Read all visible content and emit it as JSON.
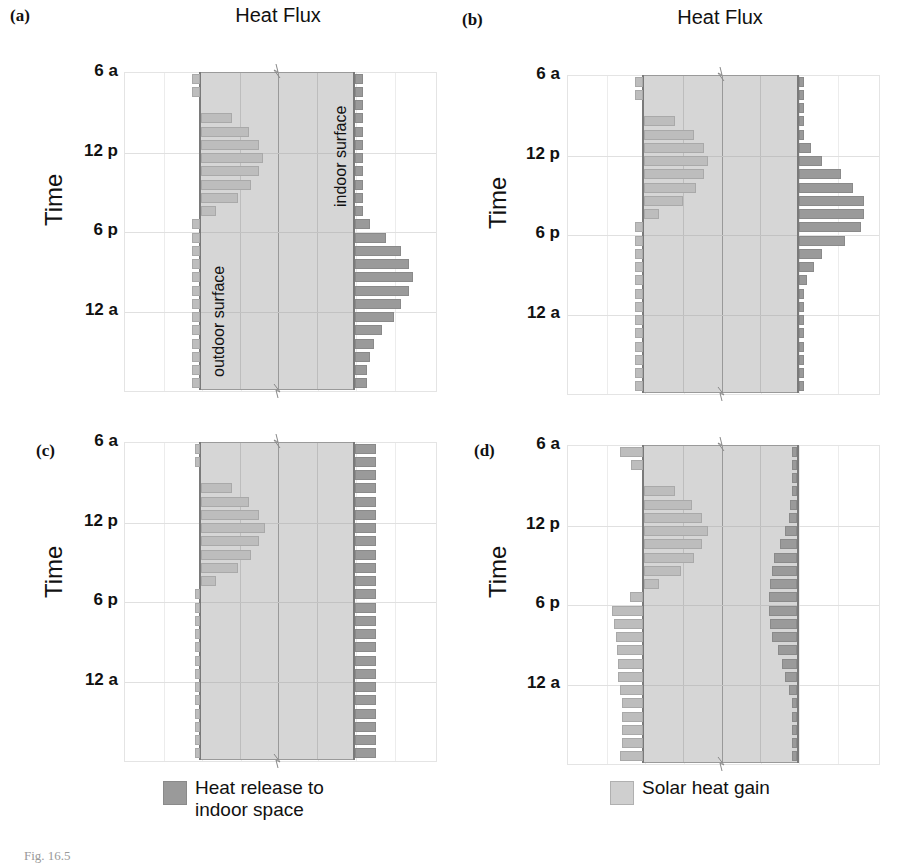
{
  "figure": {
    "caption_fragment": "Fig. 16.5"
  },
  "colors": {
    "solar": "#bdbdbd",
    "indoor": "#9a9a9a",
    "wall": "#d6d6d6",
    "wall_edge": "#7a7a7a"
  },
  "panels": [
    {
      "letter": "(a)",
      "title": "Heat Flux",
      "ylabel": "Time",
      "ticks": [
        "6 a",
        "12 p",
        "6 p",
        "12 a"
      ],
      "annotations": {
        "outdoor": "outdoor surface",
        "indoor": "indoor surface"
      }
    },
    {
      "letter": "(b)",
      "title": "Heat Flux",
      "ylabel": "Time",
      "ticks": [
        "6 a",
        "12 p",
        "6 p",
        "12 a"
      ]
    },
    {
      "letter": "(c)",
      "title": "",
      "ylabel": "Time",
      "ticks": [
        "6 a",
        "12 p",
        "6 p",
        "12 a"
      ]
    },
    {
      "letter": "(d)",
      "title": "",
      "ylabel": "Time",
      "ticks": [
        "6 a",
        "12 p",
        "6 p",
        "12 a"
      ]
    }
  ],
  "legend": {
    "indoor_label": "Heat release to indoor space",
    "solar_label": "Solar heat gain"
  },
  "chart_data": [
    {
      "type": "bar",
      "orientation": "horizontal",
      "title": "Heat Flux",
      "panel": "(a)",
      "xlabel": "Heat Flux",
      "ylabel": "Time",
      "categories": [
        "6a",
        "7a",
        "8a",
        "9a",
        "10a",
        "11a",
        "12p",
        "1p",
        "2p",
        "3p",
        "4p",
        "5p",
        "6p",
        "7p",
        "8p",
        "9p",
        "10p",
        "11p",
        "12a",
        "1a",
        "2a",
        "3a",
        "4a",
        "5a"
      ],
      "tick_labels": [
        "6 a",
        "12 p",
        "6 p",
        "12 a"
      ],
      "series": [
        {
          "name": "Solar heat gain (outdoor surface, into wall)",
          "side": "outdoor",
          "direction": "into-wall",
          "values": [
            -0.2,
            -0.2,
            0,
            0.8,
            1.25,
            1.5,
            1.6,
            1.5,
            1.3,
            0.95,
            0.4,
            -0.2,
            -0.2,
            -0.2,
            -0.2,
            -0.2,
            -0.2,
            -0.2,
            -0.2,
            -0.2,
            -0.2,
            -0.2,
            -0.2,
            -0.2
          ]
        },
        {
          "name": "Heat release to indoor space (indoor surface)",
          "side": "indoor",
          "direction": "out-of-wall",
          "values": [
            0.2,
            0.2,
            0.2,
            0.2,
            0.2,
            0.2,
            0.2,
            0.2,
            0.2,
            0.2,
            0.2,
            0.4,
            0.8,
            1.2,
            1.4,
            1.5,
            1.4,
            1.2,
            1.0,
            0.7,
            0.5,
            0.4,
            0.3,
            0.3
          ]
        }
      ],
      "grid": true
    },
    {
      "type": "bar",
      "orientation": "horizontal",
      "title": "Heat Flux",
      "panel": "(b)",
      "ylabel": "Time",
      "categories": [
        "6a",
        "7a",
        "8a",
        "9a",
        "10a",
        "11a",
        "12p",
        "1p",
        "2p",
        "3p",
        "4p",
        "5p",
        "6p",
        "7p",
        "8p",
        "9p",
        "10p",
        "11p",
        "12a",
        "1a",
        "2a",
        "3a",
        "4a",
        "5a"
      ],
      "tick_labels": [
        "6 a",
        "12 p",
        "6 p",
        "12 a"
      ],
      "series": [
        {
          "name": "Solar heat gain (outdoor surface)",
          "side": "outdoor",
          "direction": "into-wall",
          "values": [
            -0.2,
            -0.2,
            0,
            0.8,
            1.3,
            1.55,
            1.65,
            1.55,
            1.35,
            1.0,
            0.4,
            -0.2,
            -0.2,
            -0.2,
            -0.2,
            -0.2,
            -0.2,
            -0.2,
            -0.2,
            -0.2,
            -0.2,
            -0.2,
            -0.2,
            -0.2
          ]
        },
        {
          "name": "Heat release to indoor space (indoor surface)",
          "side": "indoor",
          "direction": "out-of-wall",
          "values": [
            0.1,
            0.1,
            0.1,
            0.1,
            0.1,
            0.3,
            0.6,
            1.1,
            1.4,
            1.7,
            1.7,
            1.6,
            1.2,
            0.6,
            0.4,
            0.2,
            0.1,
            0.1,
            0.1,
            0.1,
            0.1,
            0.1,
            0.1,
            0.1
          ]
        }
      ],
      "grid": true
    },
    {
      "type": "bar",
      "orientation": "horizontal",
      "panel": "(c)",
      "ylabel": "Time",
      "categories": [
        "6a",
        "7a",
        "8a",
        "9a",
        "10a",
        "11a",
        "12p",
        "1p",
        "2p",
        "3p",
        "4p",
        "5p",
        "6p",
        "7p",
        "8p",
        "9p",
        "10p",
        "11p",
        "12a",
        "1a",
        "2a",
        "3a",
        "4a",
        "5a"
      ],
      "tick_labels": [
        "6 a",
        "12 p",
        "6 p",
        "12 a"
      ],
      "series": [
        {
          "name": "Solar heat gain (outdoor surface)",
          "side": "outdoor",
          "direction": "into-wall",
          "values": [
            -0.1,
            -0.1,
            0,
            0.8,
            1.25,
            1.5,
            1.65,
            1.5,
            1.3,
            0.95,
            0.4,
            -0.1,
            -0.1,
            -0.1,
            -0.1,
            -0.1,
            -0.1,
            -0.1,
            -0.1,
            -0.1,
            -0.1,
            -0.1,
            -0.1,
            -0.1
          ]
        },
        {
          "name": "Heat release to indoor space (indoor surface)",
          "side": "indoor",
          "direction": "out-of-wall",
          "values": [
            0.55,
            0.55,
            0.55,
            0.55,
            0.55,
            0.55,
            0.55,
            0.55,
            0.55,
            0.55,
            0.55,
            0.55,
            0.55,
            0.55,
            0.55,
            0.55,
            0.55,
            0.55,
            0.55,
            0.55,
            0.55,
            0.55,
            0.55,
            0.55
          ]
        }
      ],
      "grid": true
    },
    {
      "type": "bar",
      "orientation": "horizontal",
      "panel": "(d)",
      "ylabel": "Time",
      "categories": [
        "6a",
        "7a",
        "8a",
        "9a",
        "10a",
        "11a",
        "12p",
        "1p",
        "2p",
        "3p",
        "4p",
        "5p",
        "6p",
        "7p",
        "8p",
        "9p",
        "10p",
        "11p",
        "12a",
        "1a",
        "2a",
        "3a",
        "4a",
        "5a"
      ],
      "tick_labels": [
        "6 a",
        "12 p",
        "6 p",
        "12 a"
      ],
      "series": [
        {
          "name": "Solar heat gain (outdoor surface)",
          "side": "outdoor",
          "direction": "into-wall (negative = out of wall)",
          "values": [
            -0.6,
            -0.3,
            0,
            0.8,
            1.25,
            1.5,
            1.65,
            1.5,
            1.3,
            0.95,
            0.4,
            -0.35,
            -0.8,
            -0.75,
            -0.7,
            -0.68,
            -0.66,
            -0.64,
            -0.6,
            -0.55,
            -0.55,
            -0.55,
            -0.55,
            -0.6
          ]
        },
        {
          "name": "Heat release to indoor space (indoor surface)",
          "side": "indoor",
          "direction": "into-wall (negative)",
          "values": [
            -0.05,
            -0.05,
            -0.06,
            -0.1,
            -0.17,
            -0.2,
            -0.3,
            -0.45,
            -0.6,
            -0.66,
            -0.7,
            -0.72,
            -0.72,
            -0.7,
            -0.65,
            -0.5,
            -0.38,
            -0.3,
            -0.2,
            -0.14,
            -0.1,
            -0.08,
            -0.07,
            -0.06
          ]
        }
      ],
      "grid": true
    }
  ]
}
